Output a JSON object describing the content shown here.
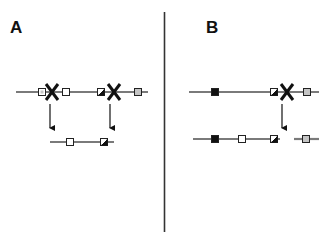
{
  "colors": {
    "line": "#7a7a7a",
    "box_stroke": "#222222",
    "box_white": "#ffffff",
    "box_black": "#111111",
    "box_gray": "#c4c4c4",
    "cross": "#111111",
    "divider": "#333333",
    "arrow": "#111111"
  },
  "panels": [
    {
      "label": "A",
      "label_pos": [
        10,
        33
      ],
      "chromosomes": [
        {
          "id": "A-top",
          "x1": 16,
          "x2": 148,
          "y": 92,
          "markers": [
            {
              "type": "hatched-light",
              "x": 42
            },
            {
              "type": "white",
              "x": 66
            },
            {
              "type": "hatched",
              "x": 101
            },
            {
              "type": "gray",
              "x": 138
            }
          ]
        },
        {
          "id": "A-bottom",
          "x1": 50,
          "x2": 114,
          "y": 142,
          "markers": [
            {
              "type": "white",
              "x": 70
            },
            {
              "type": "hatched",
              "x": 104
            }
          ]
        }
      ],
      "crossovers": [
        {
          "x": 52,
          "y": 92
        },
        {
          "x": 114,
          "y": 92
        }
      ],
      "arrows": [
        {
          "x": 50,
          "y1": 104,
          "y2": 128
        },
        {
          "x": 110,
          "y1": 104,
          "y2": 128
        }
      ]
    },
    {
      "label": "B",
      "label_pos": [
        206,
        33
      ],
      "chromosomes": [
        {
          "id": "B-top",
          "x1": 189,
          "x2": 319,
          "y": 92,
          "markers": [
            {
              "type": "black",
              "x": 215
            },
            {
              "type": "hatched",
              "x": 274
            },
            {
              "type": "gray",
              "x": 307
            }
          ]
        },
        {
          "id": "B-bottom-left",
          "x1": 193,
          "x2": 280,
          "y": 139,
          "markers": [
            {
              "type": "black",
              "x": 215
            },
            {
              "type": "white",
              "x": 242
            },
            {
              "type": "hatched",
              "x": 274
            }
          ]
        },
        {
          "id": "B-bottom-right",
          "x1": 294,
          "x2": 319,
          "y": 139,
          "markers": [
            {
              "type": "gray",
              "x": 306
            }
          ]
        }
      ],
      "crossovers": [
        {
          "x": 287,
          "y": 92
        }
      ],
      "arrows": [
        {
          "x": 282,
          "y1": 104,
          "y2": 128
        }
      ]
    }
  ],
  "divider": {
    "x": 164.5,
    "y1": 12,
    "y2": 232
  }
}
